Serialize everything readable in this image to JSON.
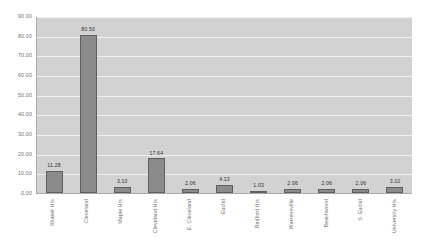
{
  "chart_data": {
    "type": "bar",
    "title": "",
    "xlabel": "",
    "ylabel": "",
    "ylim": [
      0,
      90
    ],
    "grid": true,
    "legend": "none",
    "categories": [
      "Shaker Hts",
      "Cleveland",
      "Maple Hts",
      "Cleveland Hts",
      "E. Cleveland",
      "Euclid",
      "Bedford Hts",
      "Warrensville",
      "Beachwood",
      "S. Euclid",
      "University Hts"
    ],
    "values": [
      11.28,
      80.5,
      3.1,
      17.64,
      2.06,
      4.13,
      1.03,
      2.06,
      2.06,
      2.06,
      3.1
    ],
    "value_labels": [
      "11.28",
      "80.50",
      "3.10",
      "17.64",
      "2.06",
      "4.13",
      "1.03",
      "2.06",
      "2.06",
      "2.06",
      "3.10"
    ],
    "y_ticks": [
      {
        "value": 90,
        "label": "90.00"
      },
      {
        "value": 80,
        "label": "80.00"
      },
      {
        "value": 70,
        "label": "70.00"
      },
      {
        "value": 60,
        "label": "60.00"
      },
      {
        "value": 50,
        "label": "50.00"
      },
      {
        "value": 40,
        "label": "40.00"
      },
      {
        "value": 30,
        "label": "30.00"
      },
      {
        "value": 20,
        "label": "20.00"
      },
      {
        "value": 10,
        "label": "10.00"
      },
      {
        "value": 0,
        "label": "0.00"
      }
    ],
    "colors": {
      "bar_fill": "#8b8b8b",
      "bar_border": "#5f5f5f",
      "plot_background": "#d2d2d2",
      "gridline": "#efefef",
      "axis": "#a9a9a9",
      "tick_text": "#6f6f6f",
      "value_text": "#333333",
      "page_background": "#ffffff"
    }
  }
}
